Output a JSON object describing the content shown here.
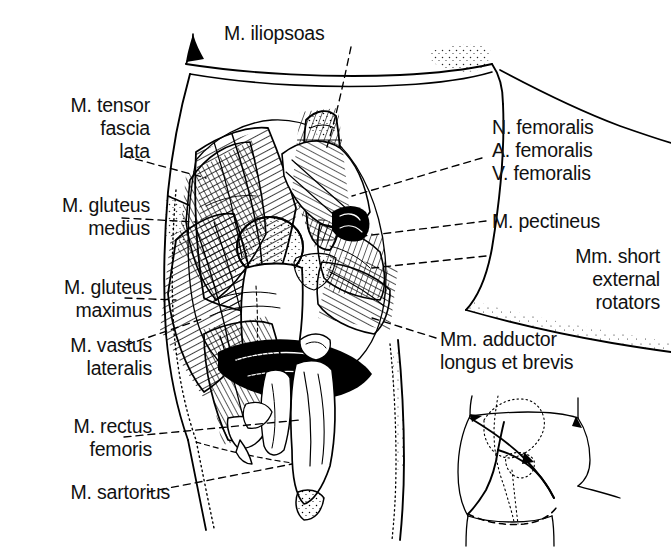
{
  "figure": {
    "kind": "anatomical-line-drawing",
    "background_color": "#ffffff",
    "ink_color": "#000000",
    "label_text_color": "#111111"
  },
  "labels": {
    "iliopsoas": "M. iliopsoas",
    "tensor_fascia_lata": "M. tensor\nfascia\nlata",
    "gluteus_medius": "M. gluteus\nmedius",
    "gluteus_maximus": "M. gluteus\nmaximus",
    "vastus_lateralis": "M. vastus\nlateralis",
    "rectus_femoris": "M. rectus\nfemoris",
    "sartorius": "M. sartorius",
    "n_femoralis": "N. femoralis",
    "a_femoralis": "A. femoralis",
    "v_femoralis": "V. femoralis",
    "pectineus": "M. pectineus",
    "short_external_rotators": "Mm. short\nexternal\nrotators",
    "adductor_longus_brevis": "Mm. adductor\nlongus et brevis"
  },
  "label_list": [
    {
      "id": "iliopsoas",
      "text": "M. iliopsoas",
      "side": "top"
    },
    {
      "id": "tensor-fascia-lata",
      "text": "M. tensor fascia lata",
      "side": "left"
    },
    {
      "id": "gluteus-medius",
      "text": "M. gluteus medius",
      "side": "left"
    },
    {
      "id": "gluteus-maximus",
      "text": "M. gluteus maximus",
      "side": "left"
    },
    {
      "id": "vastus-lateralis",
      "text": "M. vastus lateralis",
      "side": "left"
    },
    {
      "id": "rectus-femoris",
      "text": "M. rectus femoris",
      "side": "left"
    },
    {
      "id": "sartorius",
      "text": "M. sartorius",
      "side": "left"
    },
    {
      "id": "n-femoralis",
      "text": "N. femoralis",
      "side": "right"
    },
    {
      "id": "a-femoralis",
      "text": "A. femoralis",
      "side": "right"
    },
    {
      "id": "v-femoralis",
      "text": "V. femoralis",
      "side": "right"
    },
    {
      "id": "pectineus",
      "text": "M. pectineus",
      "side": "right"
    },
    {
      "id": "short-external-rotators",
      "text": "Mm. short external rotators",
      "side": "right"
    },
    {
      "id": "adductor-longus-brevis",
      "text": "Mm. adductor longus et brevis",
      "side": "right"
    }
  ],
  "inset": {
    "present": true,
    "description": "orientation diagram of hip with skin incision lines",
    "position": "bottom-right"
  },
  "caption": {
    "visible": false,
    "text": ""
  }
}
